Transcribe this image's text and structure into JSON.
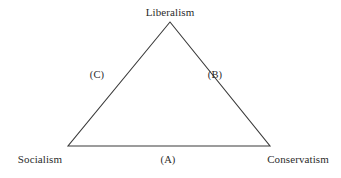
{
  "diagram": {
    "type": "triangle-diagram",
    "background_color": "#ffffff",
    "stroke_color": "#3a3a3a",
    "text_color": "#2b2b2b",
    "vertices": {
      "top": {
        "label": "Liberalism",
        "x": 170,
        "y": 22,
        "label_x": 170,
        "label_y": 12
      },
      "bottom_left": {
        "label": "Socialism",
        "x": 68,
        "y": 146,
        "label_x": 40,
        "label_y": 159
      },
      "bottom_right": {
        "label": "Conservatism",
        "x": 270,
        "y": 146,
        "label_x": 298,
        "label_y": 159
      }
    },
    "edges": {
      "base": {
        "label": "(A)",
        "label_x": 168,
        "label_y": 159,
        "from": "bottom_left",
        "to": "bottom_right"
      },
      "right": {
        "label": "(B)",
        "label_x": 215,
        "label_y": 74,
        "from": "top",
        "to": "bottom_right"
      },
      "left": {
        "label": "(C)",
        "label_x": 97,
        "label_y": 74,
        "from": "top",
        "to": "bottom_left"
      }
    }
  }
}
